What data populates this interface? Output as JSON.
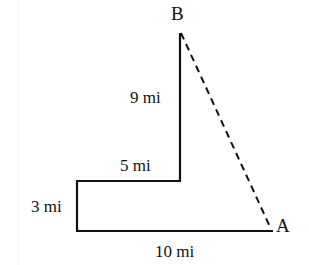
{
  "diagram": {
    "points": {
      "A": {
        "label": "A"
      },
      "B": {
        "label": "B"
      }
    },
    "segments": [
      {
        "id": "bottom",
        "label": "10 mi"
      },
      {
        "id": "left",
        "label": "3 mi"
      },
      {
        "id": "middle",
        "label": "5 mi"
      },
      {
        "id": "vertical",
        "label": "9 mi"
      }
    ],
    "dashed_segment": {
      "from": "A",
      "to": "B"
    },
    "colors": {
      "stroke": "#111111",
      "background": "#ffffff"
    }
  }
}
